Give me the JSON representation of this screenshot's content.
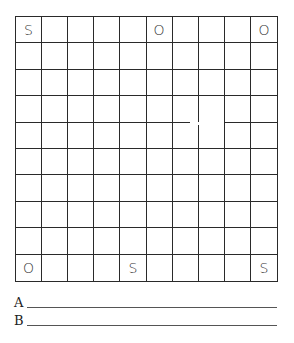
{
  "game": "SOS",
  "board": {
    "rows": 10,
    "cols": 10,
    "cells": [
      [
        "S",
        "",
        "",
        "",
        "",
        "O",
        "",
        "",
        "",
        "O"
      ],
      [
        "",
        "",
        "",
        "",
        "",
        "",
        "",
        "",
        "",
        ""
      ],
      [
        "",
        "",
        "",
        "",
        "",
        "",
        "",
        "",
        "",
        ""
      ],
      [
        "",
        "",
        "",
        "",
        "",
        "",
        "",
        "",
        "",
        ""
      ],
      [
        "",
        "",
        "",
        "",
        "",
        "",
        "",
        "",
        "",
        ""
      ],
      [
        "",
        "",
        "",
        "",
        "",
        "",
        "",
        "",
        "",
        ""
      ],
      [
        "",
        "",
        "",
        "",
        "",
        "",
        "",
        "",
        "",
        ""
      ],
      [
        "",
        "",
        "",
        "",
        "",
        "",
        "",
        "",
        "",
        ""
      ],
      [
        "",
        "",
        "",
        "",
        "",
        "",
        "",
        "",
        "",
        ""
      ],
      [
        "O",
        "",
        "",
        "",
        "S",
        "",
        "",
        "",
        "",
        "S"
      ]
    ]
  },
  "players": [
    {
      "label": "A",
      "name": ""
    },
    {
      "label": "B",
      "name": ""
    }
  ]
}
